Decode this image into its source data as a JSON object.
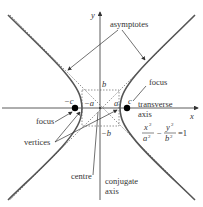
{
  "labels": {
    "y_axis": "y",
    "x_axis": "x",
    "asymptotes": "asymptotes",
    "focus_right": "focus",
    "focus_left": "focus",
    "vertices": "vertices",
    "centre": "centre",
    "transverse_1": "transverse",
    "transverse_2": "axis",
    "conjugate_1": "conjugate",
    "conjugate_2": "axis",
    "b_top": "b",
    "b_bottom": "−b",
    "a_right": "a",
    "a_left": "−a",
    "c_right": "c",
    "c_left": "−c"
  },
  "equation": {
    "x_num": "x",
    "x_den": "a",
    "y_num": "y",
    "y_den": "b",
    "exp": "2",
    "minus": "−",
    "equals": "=1"
  },
  "colors": {
    "curve": "#555555",
    "axis": "#333333",
    "dashed": "#555555",
    "focus_dot": "#000000"
  }
}
